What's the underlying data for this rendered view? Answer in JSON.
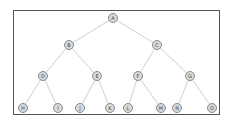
{
  "diagram": {
    "type": "binary-tree",
    "colors": {
      "node_fill": "#d9d9d9",
      "node_stroke": "#8a8a8a",
      "edge": "#cfcfcf",
      "frame": "#555555",
      "label": "#444444"
    },
    "nodes": [
      {
        "id": "A",
        "label": "A",
        "x": 113,
        "y": 18
      },
      {
        "id": "B",
        "label": "B",
        "x": 69,
        "y": 45
      },
      {
        "id": "C",
        "label": "C",
        "x": 157,
        "y": 45
      },
      {
        "id": "D",
        "label": "D",
        "x": 43,
        "y": 76
      },
      {
        "id": "E",
        "label": "E",
        "x": 97,
        "y": 76
      },
      {
        "id": "F",
        "label": "F",
        "x": 138,
        "y": 76
      },
      {
        "id": "G",
        "label": "G",
        "x": 190,
        "y": 76
      },
      {
        "id": "H",
        "label": "H",
        "x": 23,
        "y": 108
      },
      {
        "id": "I",
        "label": "I",
        "x": 58,
        "y": 108
      },
      {
        "id": "J",
        "label": "J",
        "x": 80,
        "y": 108
      },
      {
        "id": "K",
        "label": "K",
        "x": 110,
        "y": 108
      },
      {
        "id": "L",
        "label": "L",
        "x": 128,
        "y": 108
      },
      {
        "id": "M",
        "label": "M",
        "x": 161,
        "y": 108
      },
      {
        "id": "N",
        "label": "N",
        "x": 177,
        "y": 108
      },
      {
        "id": "O",
        "label": "O",
        "x": 212,
        "y": 108
      }
    ],
    "edges": [
      [
        "A",
        "B"
      ],
      [
        "A",
        "C"
      ],
      [
        "B",
        "D"
      ],
      [
        "B",
        "E"
      ],
      [
        "C",
        "F"
      ],
      [
        "C",
        "G"
      ],
      [
        "D",
        "H"
      ],
      [
        "D",
        "I"
      ],
      [
        "E",
        "J"
      ],
      [
        "E",
        "K"
      ],
      [
        "F",
        "L"
      ],
      [
        "F",
        "M"
      ],
      [
        "G",
        "N"
      ],
      [
        "G",
        "O"
      ]
    ]
  }
}
